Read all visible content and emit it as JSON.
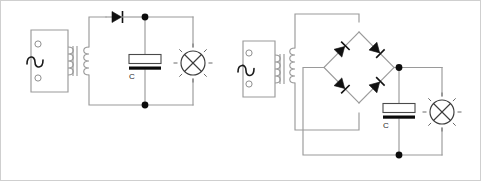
{
  "figure": {
    "background_color": "#ffffff",
    "wire_color": "#9a9a9a",
    "component_color": "#111111",
    "border_color": "#cfcfcf",
    "width": 481,
    "height": 181
  },
  "circuits": [
    {
      "id": "half-wave-rectifier",
      "name": "Half-wave rectifier with smoothing capacitor",
      "components": [
        {
          "type": "ac-source",
          "label": "",
          "symbol": "sine-wave",
          "terminals": 2
        },
        {
          "type": "transformer",
          "label": "",
          "symbol": "iron-core-transformer",
          "windings": 2,
          "core_bars": 2
        },
        {
          "type": "diode",
          "label": "",
          "symbol": "diode",
          "count": 1,
          "direction": "right"
        },
        {
          "type": "capacitor",
          "label": "C",
          "symbol": "polarized-capacitor"
        },
        {
          "type": "lamp",
          "label": "",
          "symbol": "lamp-x-in-circle",
          "rays": 8
        },
        {
          "type": "junction",
          "label": "",
          "symbol": "node-dot",
          "count": 2
        }
      ]
    },
    {
      "id": "full-wave-bridge-rectifier",
      "name": "Full-wave bridge rectifier with smoothing capacitor",
      "components": [
        {
          "type": "ac-source",
          "label": "",
          "symbol": "sine-wave",
          "terminals": 2
        },
        {
          "type": "transformer",
          "label": "",
          "symbol": "iron-core-transformer",
          "windings": 2,
          "core_bars": 2
        },
        {
          "type": "diode-bridge",
          "label": "",
          "symbol": "graetz-bridge",
          "count": 4,
          "diode_directions": [
            "up-right",
            "down-right",
            "down-right",
            "up-right"
          ]
        },
        {
          "type": "capacitor",
          "label": "C",
          "symbol": "polarized-capacitor"
        },
        {
          "type": "lamp",
          "label": "",
          "symbol": "lamp-x-in-circle",
          "rays": 8
        },
        {
          "type": "junction",
          "label": "",
          "symbol": "node-dot",
          "count": 2
        }
      ]
    }
  ],
  "labels": {
    "left_capacitor": "C",
    "right_capacitor": "C"
  }
}
